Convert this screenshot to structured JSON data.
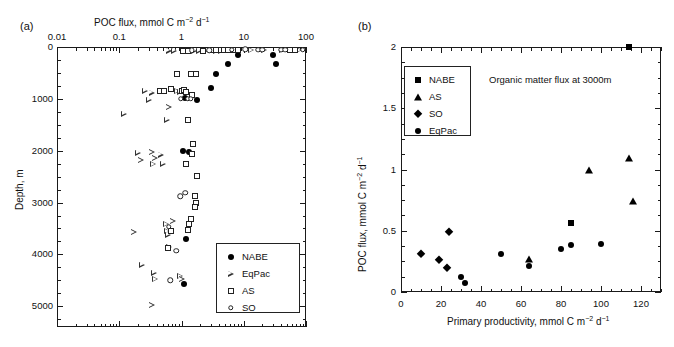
{
  "figure": {
    "panel_a_label": "(a)",
    "panel_b_label": "(b)"
  },
  "panel_a": {
    "top_axis_title_plain": "POC flux, mmol C m-2 d-1",
    "y_axis_title": "Depth, m",
    "x_scale": "log",
    "x_ticklabels": [
      "0.01",
      "0.1",
      "1",
      "10",
      "100"
    ],
    "x_tickvalues": [
      0.01,
      0.1,
      1,
      10,
      100
    ],
    "y_ticklabels": [
      "0",
      "1000",
      "2000",
      "3000",
      "4000",
      "5000"
    ],
    "y_tickvalues": [
      0,
      1000,
      2000,
      3000,
      4000,
      5000
    ],
    "legend": [
      {
        "label": "NABE",
        "marker": "filled-circle"
      },
      {
        "label": "EqPac",
        "marker": "open-triangle-right"
      },
      {
        "label": "AS",
        "marker": "open-square"
      },
      {
        "label": "SO",
        "marker": "open-circle"
      }
    ]
  },
  "panel_b": {
    "x_axis_title_plain": "Primary productivity, mmol C m-2 d-1",
    "y_axis_title_plain": "POC flux, mmol C m-2 d-1",
    "annotation": "Organic matter flux at 3000m",
    "x_ticklabels": [
      "0",
      "20",
      "40",
      "60",
      "80",
      "100",
      "120"
    ],
    "x_tickvalues": [
      0,
      20,
      40,
      60,
      80,
      100,
      120
    ],
    "y_ticklabels": [
      "0",
      "0.5",
      "1",
      "1.5",
      "2"
    ],
    "y_tickvalues": [
      0,
      0.5,
      1,
      1.5,
      2
    ],
    "legend": [
      {
        "label": "NABE",
        "marker": "filled-square"
      },
      {
        "label": "AS",
        "marker": "filled-triangle-up"
      },
      {
        "label": "SO",
        "marker": "filled-diamond"
      },
      {
        "label": "EqPac",
        "marker": "filled-circle"
      }
    ]
  },
  "chart_data": [
    {
      "type": "scatter",
      "panel": "(a)",
      "title": "POC flux, mmol C m-2 d-1",
      "xlabel": "POC flux, mmol C m−2 d−1",
      "ylabel": "Depth, m",
      "xscale": "log",
      "xlim": [
        0.01,
        100
      ],
      "ylim": [
        0,
        5400
      ],
      "y_inverted": true,
      "grid": false,
      "legend_position": "lower-right",
      "series": [
        {
          "name": "NABE",
          "marker": "filled-circle",
          "points": [
            {
              "flux": 8.0,
              "depth": 150
            },
            {
              "flux": 30.0,
              "depth": 150
            },
            {
              "flux": 5.6,
              "depth": 330
            },
            {
              "flux": 33.0,
              "depth": 330
            },
            {
              "flux": 3.6,
              "depth": 520
            },
            {
              "flux": 3.0,
              "depth": 790
            },
            {
              "flux": 1.15,
              "depth": 980
            },
            {
              "flux": 1.8,
              "depth": 1030
            },
            {
              "flux": 1.25,
              "depth": 1400
            },
            {
              "flux": 1.05,
              "depth": 2000
            },
            {
              "flux": 1.3,
              "depth": 2030
            },
            {
              "flux": 1.2,
              "depth": 3700
            },
            {
              "flux": 1.1,
              "depth": 4570
            }
          ]
        },
        {
          "name": "EqPac",
          "marker": "open-triangle-right",
          "points": [
            {
              "flux": 0.62,
              "depth": 70
            },
            {
              "flux": 0.75,
              "depth": 70
            },
            {
              "flux": 1.05,
              "depth": 70
            },
            {
              "flux": 1.35,
              "depth": 70
            },
            {
              "flux": 1.6,
              "depth": 70
            },
            {
              "flux": 1.9,
              "depth": 70
            },
            {
              "flux": 2.4,
              "depth": 70
            },
            {
              "flux": 3.6,
              "depth": 70
            },
            {
              "flux": 4.3,
              "depth": 70
            },
            {
              "flux": 13.0,
              "depth": 60
            },
            {
              "flux": 21.0,
              "depth": 60
            },
            {
              "flux": 41.0,
              "depth": 60
            },
            {
              "flux": 78.0,
              "depth": 60
            },
            {
              "flux": 0.26,
              "depth": 840
            },
            {
              "flux": 0.33,
              "depth": 880
            },
            {
              "flux": 0.84,
              "depth": 850
            },
            {
              "flux": 0.95,
              "depth": 860
            },
            {
              "flux": 0.12,
              "depth": 1290
            },
            {
              "flux": 0.3,
              "depth": 1020
            },
            {
              "flux": 0.62,
              "depth": 1160
            },
            {
              "flux": 0.58,
              "depth": 1400
            },
            {
              "flux": 0.2,
              "depth": 2040
            },
            {
              "flux": 0.22,
              "depth": 2180
            },
            {
              "flux": 0.33,
              "depth": 2030
            },
            {
              "flux": 0.37,
              "depth": 2150
            },
            {
              "flux": 0.35,
              "depth": 2260
            },
            {
              "flux": 0.46,
              "depth": 2080
            },
            {
              "flux": 0.5,
              "depth": 2250
            },
            {
              "flux": 0.17,
              "depth": 3570
            },
            {
              "flux": 0.56,
              "depth": 3420
            },
            {
              "flux": 0.59,
              "depth": 3550
            },
            {
              "flux": 0.6,
              "depth": 3620
            },
            {
              "flux": 0.72,
              "depth": 3360
            },
            {
              "flux": 0.63,
              "depth": 3860
            },
            {
              "flux": 0.23,
              "depth": 4200
            },
            {
              "flux": 0.36,
              "depth": 4350
            },
            {
              "flux": 0.38,
              "depth": 4480
            },
            {
              "flux": 0.95,
              "depth": 4420
            },
            {
              "flux": 1.0,
              "depth": 4480
            },
            {
              "flux": 0.33,
              "depth": 4980
            }
          ]
        },
        {
          "name": "AS",
          "marker": "open-square",
          "points": [
            {
              "flux": 1.05,
              "depth": 70
            },
            {
              "flux": 1.25,
              "depth": 70
            },
            {
              "flux": 2.2,
              "depth": 70
            },
            {
              "flux": 3.1,
              "depth": 60
            },
            {
              "flux": 3.6,
              "depth": 65
            },
            {
              "flux": 4.3,
              "depth": 65
            },
            {
              "flux": 4.9,
              "depth": 65
            },
            {
              "flux": 5.6,
              "depth": 65
            },
            {
              "flux": 7.0,
              "depth": 60
            },
            {
              "flux": 8.0,
              "depth": 65
            },
            {
              "flux": 56.0,
              "depth": 60
            },
            {
              "flux": 66.0,
              "depth": 60
            },
            {
              "flux": 0.85,
              "depth": 530
            },
            {
              "flux": 1.4,
              "depth": 520
            },
            {
              "flux": 1.7,
              "depth": 520
            },
            {
              "flux": 0.45,
              "depth": 840
            },
            {
              "flux": 0.52,
              "depth": 850
            },
            {
              "flux": 0.68,
              "depth": 810
            },
            {
              "flux": 1.0,
              "depth": 850
            },
            {
              "flux": 1.1,
              "depth": 830
            },
            {
              "flux": 1.2,
              "depth": 870
            },
            {
              "flux": 1.5,
              "depth": 920
            },
            {
              "flux": 1.25,
              "depth": 1400
            },
            {
              "flux": 1.55,
              "depth": 1870
            },
            {
              "flux": 1.45,
              "depth": 2070
            },
            {
              "flux": 1.2,
              "depth": 2250
            },
            {
              "flux": 1.75,
              "depth": 2480
            },
            {
              "flux": 1.65,
              "depth": 2880
            },
            {
              "flux": 1.7,
              "depth": 3010
            },
            {
              "flux": 1.65,
              "depth": 3090
            },
            {
              "flux": 1.4,
              "depth": 3320
            },
            {
              "flux": 1.3,
              "depth": 3420
            },
            {
              "flux": 1.25,
              "depth": 3530
            },
            {
              "flux": 0.68,
              "depth": 3550
            },
            {
              "flux": 0.6,
              "depth": 3880
            }
          ]
        },
        {
          "name": "SO",
          "marker": "open-circle",
          "points": [
            {
              "flux": 1.45,
              "depth": 60
            },
            {
              "flux": 2.8,
              "depth": 60
            },
            {
              "flux": 6.4,
              "depth": 55
            },
            {
              "flux": 10.5,
              "depth": 45
            },
            {
              "flux": 17.0,
              "depth": 55
            },
            {
              "flux": 20.0,
              "depth": 55
            },
            {
              "flux": 40.0,
              "depth": 55
            },
            {
              "flux": 46.0,
              "depth": 55
            },
            {
              "flux": 88.0,
              "depth": 55
            },
            {
              "flux": 0.98,
              "depth": 1000
            },
            {
              "flux": 1.25,
              "depth": 1000
            },
            {
              "flux": 1.4,
              "depth": 1000
            },
            {
              "flux": 0.95,
              "depth": 2880
            },
            {
              "flux": 1.15,
              "depth": 2810
            },
            {
              "flux": 0.82,
              "depth": 3930
            },
            {
              "flux": 0.62,
              "depth": 3470
            },
            {
              "flux": 0.66,
              "depth": 4500
            }
          ]
        }
      ]
    },
    {
      "type": "scatter",
      "panel": "(b)",
      "title": "Organic matter flux at 3000m",
      "xlabel": "Primary productivity, mmol C m−2 d−1",
      "ylabel": "POC flux, mmol C m−2 d−1",
      "xlim": [
        0,
        130
      ],
      "ylim": [
        0,
        2
      ],
      "grid": false,
      "legend_position": "upper-left",
      "series": [
        {
          "name": "NABE",
          "marker": "filled-square",
          "points": [
            {
              "x": 85,
              "y": 0.56
            },
            {
              "x": 114,
              "y": 2.0
            }
          ]
        },
        {
          "name": "AS",
          "marker": "filled-triangle-up",
          "points": [
            {
              "x": 64,
              "y": 0.27
            },
            {
              "x": 94,
              "y": 1.0
            },
            {
              "x": 114,
              "y": 1.09
            },
            {
              "x": 116,
              "y": 0.74
            }
          ]
        },
        {
          "name": "SO",
          "marker": "filled-diamond",
          "points": [
            {
              "x": 10,
              "y": 0.31
            },
            {
              "x": 19,
              "y": 0.26
            },
            {
              "x": 23,
              "y": 0.2
            },
            {
              "x": 24,
              "y": 0.49
            }
          ]
        },
        {
          "name": "EqPac",
          "marker": "filled-circle",
          "points": [
            {
              "x": 30,
              "y": 0.12
            },
            {
              "x": 32,
              "y": 0.07
            },
            {
              "x": 50,
              "y": 0.31
            },
            {
              "x": 64,
              "y": 0.21
            },
            {
              "x": 80,
              "y": 0.35
            },
            {
              "x": 85,
              "y": 0.38
            },
            {
              "x": 100,
              "y": 0.39
            }
          ]
        }
      ]
    }
  ]
}
